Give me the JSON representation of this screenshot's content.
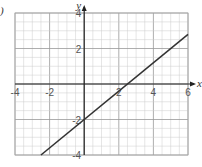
{
  "chart_data": {
    "type": "line",
    "title": "",
    "xlabel": "x",
    "ylabel": "y",
    "xlim": [
      -4,
      6
    ],
    "ylim": [
      -4,
      4
    ],
    "grid": true,
    "minor_grid_step": 0.5,
    "major_grid_step": 2,
    "x_ticks": [
      "-4",
      "-2",
      "2",
      "4",
      "6"
    ],
    "y_ticks": [
      "4",
      "2",
      "-2",
      "-4"
    ],
    "series": [
      {
        "name": "line",
        "equation": "y = 0.8x - 2",
        "x": [
          -2.5,
          6
        ],
        "y": [
          -4,
          2.8
        ]
      }
    ],
    "color": "#333333"
  },
  "labels": {
    "corner_mark": ")"
  }
}
